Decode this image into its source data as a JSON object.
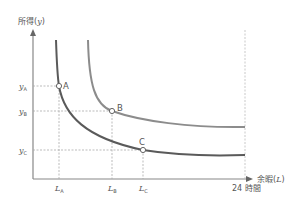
{
  "diagram": {
    "type": "indifference-curves",
    "y_axis": {
      "label": "所得",
      "symbol": "y"
    },
    "x_axis": {
      "label": "余暇",
      "symbol": "L",
      "max_label": "24 時間"
    },
    "y_ticks": [
      {
        "base": "y",
        "sub": "A"
      },
      {
        "base": "y",
        "sub": "B"
      },
      {
        "base": "y",
        "sub": "C"
      }
    ],
    "x_ticks": [
      {
        "base": "L",
        "sub": "A"
      },
      {
        "base": "L",
        "sub": "B"
      },
      {
        "base": "L",
        "sub": "C"
      }
    ],
    "points": [
      {
        "label": "A",
        "curve": "lower"
      },
      {
        "label": "B",
        "curve": "upper"
      },
      {
        "label": "C",
        "curve": "lower"
      }
    ],
    "curves": [
      {
        "name": "upper",
        "color": "#8c8c8c"
      },
      {
        "name": "lower",
        "color": "#5a5a5a"
      }
    ],
    "colors": {
      "axis": "#888888",
      "guide": "#aaaaaa",
      "text": "#555555"
    }
  }
}
